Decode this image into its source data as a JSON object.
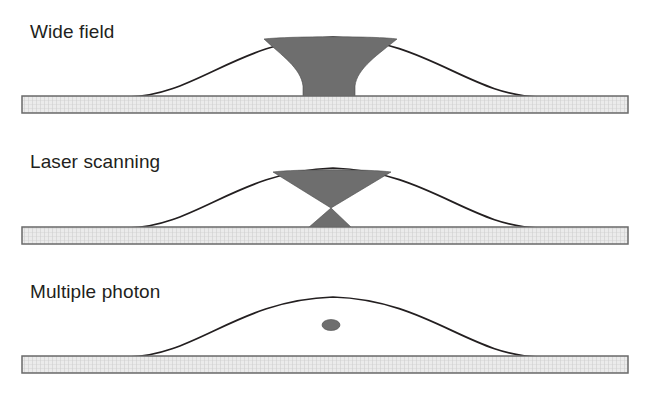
{
  "figure": {
    "width": 658,
    "height": 393,
    "background_color": "#ffffff"
  },
  "style": {
    "outline_color": "#231f20",
    "excitation_fill": "#6e6e6e",
    "slab_fill": "#e8e8e8",
    "slab_border": "#6a6a6a",
    "slab_hatch_color": "#b8b8b8",
    "label_color": "#231f20"
  },
  "panels": [
    {
      "id": "wide-field",
      "label": "Wide field",
      "label_x": 30,
      "label_y": 38,
      "slab": {
        "x": 22,
        "y": 96,
        "width": 606,
        "height": 17
      },
      "dome": {
        "left_x": 128,
        "right_x": 540,
        "base_y": 97,
        "apex_x": 333,
        "apex_y": 36
      },
      "excitation": {
        "shape": "vase",
        "description": "Wide hourglass column spanning from dome apex down to substrate",
        "top_left_x": 263,
        "top_right_x": 398,
        "top_y": 38,
        "waist_left_x": 303,
        "waist_right_x": 355,
        "bottom_left_x": 303,
        "bottom_right_x": 355,
        "bottom_y": 97
      }
    },
    {
      "id": "laser-scanning",
      "label": "Laser scanning",
      "label_x": 30,
      "label_y": 168,
      "slab": {
        "x": 22,
        "y": 227,
        "width": 606,
        "height": 17
      },
      "dome": {
        "left_x": 128,
        "right_x": 540,
        "base_y": 228,
        "apex_x": 333,
        "apex_y": 167
      },
      "excitation": {
        "shape": "bowtie",
        "description": "Double cone converging to focal waist just above substrate",
        "top_left_x": 272,
        "top_right_x": 392,
        "top_y": 170,
        "waist_x": 331,
        "waist_y": 208,
        "bottom_left_x": 308,
        "bottom_right_x": 352,
        "bottom_y": 228
      }
    },
    {
      "id": "multiple-photon",
      "label": "Multiple photon",
      "label_x": 30,
      "label_y": 298,
      "slab": {
        "x": 22,
        "y": 356,
        "width": 606,
        "height": 17
      },
      "dome": {
        "left_x": 128,
        "right_x": 540,
        "base_y": 357,
        "apex_x": 333,
        "apex_y": 296
      },
      "excitation": {
        "shape": "ellipse",
        "description": "Small confined focal volume spot",
        "center_x": 331,
        "center_y": 325,
        "radius_x": 9,
        "radius_y": 5.5
      }
    }
  ]
}
